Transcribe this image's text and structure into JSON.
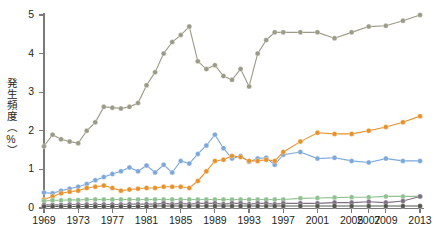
{
  "chart_data": {
    "type": "line",
    "title": "",
    "xlabel": "年",
    "ylabel": "発生頻度（%）",
    "ylim": [
      0,
      5
    ],
    "xlim": [
      1969,
      2013
    ],
    "grid": false,
    "legend": "none",
    "y_ticks": [
      "0",
      "1",
      "2",
      "3",
      "4",
      "5"
    ],
    "y_tick_values": [
      0,
      1,
      2,
      3,
      4,
      5
    ],
    "x_ticks": [
      "1969",
      "1973",
      "1977",
      "1981",
      "1985",
      "1989",
      "1993",
      "1997",
      "2001",
      "2005",
      "2007",
      "2009",
      "2013"
    ],
    "x_tick_values": [
      1969,
      1973,
      1977,
      1981,
      1985,
      1989,
      1993,
      1997,
      2001,
      2005,
      2007,
      2009,
      2013
    ],
    "x_unit_label": "（年）",
    "series": [
      {
        "name": "series-khaki",
        "color": "#9a9a86",
        "x": [
          1969,
          1970,
          1971,
          1972,
          1973,
          1974,
          1975,
          1976,
          1977,
          1978,
          1979,
          1980,
          1981,
          1982,
          1983,
          1984,
          1985,
          1986,
          1987,
          1988,
          1989,
          1990,
          1991,
          1992,
          1993,
          1994,
          1995,
          1996,
          1997,
          1999,
          2001,
          2003,
          2005,
          2007,
          2009,
          2011,
          2013
        ],
        "values": [
          1.6,
          1.9,
          1.78,
          1.72,
          1.68,
          2.0,
          2.22,
          2.62,
          2.6,
          2.58,
          2.62,
          2.72,
          3.18,
          3.52,
          4.0,
          4.3,
          4.48,
          4.7,
          3.8,
          3.6,
          3.7,
          3.42,
          3.32,
          3.6,
          3.15,
          4.0,
          4.35,
          4.55,
          4.55,
          4.55,
          4.55,
          4.4,
          4.55,
          4.7,
          4.72,
          4.85,
          5.0
        ]
      },
      {
        "name": "series-blue",
        "color": "#7ba7db",
        "x": [
          1969,
          1970,
          1971,
          1972,
          1973,
          1974,
          1975,
          1976,
          1977,
          1978,
          1979,
          1980,
          1981,
          1982,
          1983,
          1984,
          1985,
          1986,
          1987,
          1988,
          1989,
          1990,
          1991,
          1992,
          1993,
          1994,
          1995,
          1996,
          1997,
          1999,
          2001,
          2003,
          2005,
          2007,
          2009,
          2011,
          2013
        ],
        "values": [
          0.4,
          0.38,
          0.45,
          0.5,
          0.55,
          0.62,
          0.72,
          0.8,
          0.88,
          0.95,
          1.05,
          0.95,
          1.1,
          0.92,
          1.12,
          0.92,
          1.22,
          1.15,
          1.4,
          1.62,
          1.9,
          1.55,
          1.28,
          1.35,
          1.2,
          1.28,
          1.3,
          1.12,
          1.38,
          1.45,
          1.28,
          1.3,
          1.22,
          1.18,
          1.28,
          1.22,
          1.22
        ]
      },
      {
        "name": "series-orange",
        "color": "#e8912b",
        "x": [
          1969,
          1970,
          1971,
          1972,
          1973,
          1974,
          1975,
          1976,
          1977,
          1978,
          1979,
          1980,
          1981,
          1982,
          1983,
          1984,
          1985,
          1986,
          1987,
          1988,
          1989,
          1990,
          1991,
          1992,
          1993,
          1994,
          1995,
          1996,
          1997,
          1999,
          2001,
          2003,
          2005,
          2007,
          2009,
          2011,
          2013
        ],
        "values": [
          0.22,
          0.3,
          0.38,
          0.42,
          0.45,
          0.52,
          0.55,
          0.58,
          0.52,
          0.45,
          0.48,
          0.5,
          0.52,
          0.52,
          0.55,
          0.55,
          0.55,
          0.52,
          0.7,
          0.95,
          1.22,
          1.25,
          1.35,
          1.32,
          1.22,
          1.22,
          1.25,
          1.22,
          1.45,
          1.72,
          1.95,
          1.92,
          1.92,
          2.0,
          2.1,
          2.22,
          2.38
        ]
      },
      {
        "name": "series-green",
        "color": "#8fc08f",
        "x": [
          1969,
          1970,
          1971,
          1972,
          1973,
          1974,
          1975,
          1976,
          1977,
          1978,
          1979,
          1980,
          1981,
          1982,
          1983,
          1984,
          1985,
          1986,
          1987,
          1988,
          1989,
          1990,
          1991,
          1992,
          1993,
          1994,
          1995,
          1996,
          1997,
          1999,
          2001,
          2003,
          2005,
          2007,
          2009,
          2011,
          2013
        ],
        "values": [
          0.18,
          0.2,
          0.2,
          0.21,
          0.21,
          0.22,
          0.22,
          0.22,
          0.22,
          0.22,
          0.22,
          0.22,
          0.22,
          0.22,
          0.22,
          0.22,
          0.22,
          0.22,
          0.22,
          0.22,
          0.22,
          0.22,
          0.22,
          0.22,
          0.22,
          0.22,
          0.22,
          0.22,
          0.22,
          0.25,
          0.26,
          0.27,
          0.28,
          0.28,
          0.3,
          0.3,
          0.3
        ]
      },
      {
        "name": "series-purple",
        "color": "#7d6e82",
        "x": [
          1969,
          1970,
          1971,
          1972,
          1973,
          1974,
          1975,
          1976,
          1977,
          1978,
          1979,
          1980,
          1981,
          1982,
          1983,
          1984,
          1985,
          1986,
          1987,
          1988,
          1989,
          1990,
          1991,
          1992,
          1993,
          1994,
          1995,
          1996,
          1997,
          1999,
          2001,
          2003,
          2005,
          2007,
          2009,
          2011,
          2013
        ],
        "values": [
          0.08,
          0.08,
          0.08,
          0.09,
          0.09,
          0.09,
          0.09,
          0.09,
          0.09,
          0.09,
          0.1,
          0.1,
          0.1,
          0.1,
          0.12,
          0.1,
          0.12,
          0.1,
          0.12,
          0.12,
          0.12,
          0.1,
          0.12,
          0.12,
          0.1,
          0.12,
          0.12,
          0.1,
          0.12,
          0.12,
          0.12,
          0.14,
          0.14,
          0.16,
          0.14,
          0.18,
          0.3
        ]
      },
      {
        "name": "series-darkgray",
        "color": "#55564f",
        "x": [
          1969,
          1970,
          1971,
          1972,
          1973,
          1974,
          1975,
          1976,
          1977,
          1978,
          1979,
          1980,
          1981,
          1982,
          1983,
          1984,
          1985,
          1986,
          1987,
          1988,
          1989,
          1990,
          1991,
          1992,
          1993,
          1994,
          1995,
          1996,
          1997,
          1999,
          2001,
          2003,
          2005,
          2007,
          2009,
          2011,
          2013
        ],
        "values": [
          0.04,
          0.04,
          0.04,
          0.04,
          0.04,
          0.04,
          0.04,
          0.04,
          0.04,
          0.04,
          0.04,
          0.04,
          0.04,
          0.05,
          0.05,
          0.05,
          0.05,
          0.05,
          0.05,
          0.05,
          0.05,
          0.05,
          0.05,
          0.05,
          0.05,
          0.05,
          0.05,
          0.05,
          0.05,
          0.05,
          0.05,
          0.05,
          0.05,
          0.05,
          0.05,
          0.05,
          0.05
        ]
      }
    ]
  }
}
